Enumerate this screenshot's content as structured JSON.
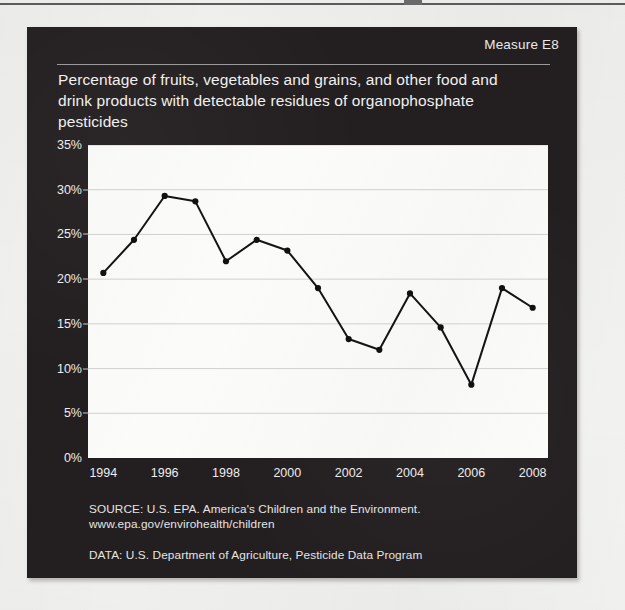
{
  "panel": {
    "measure_label": "Measure E8",
    "title": "Percentage of fruits, vegetables and grains, and other food and drink products with detectable residues of organophosphate pesticides",
    "source_note": "SOURCE: U.S. EPA. America's Children and the Environment.\nwww.epa.gov/envirohealth/children",
    "data_note": "DATA: U.S. Department of Agriculture, Pesticide Data Program",
    "colors": {
      "panel_background": "#231f20",
      "plot_background": "#fbfbf9",
      "text": "#eeeeee",
      "series_line": "#111111",
      "gridline": "#d0d0d0"
    }
  },
  "chart_data": {
    "type": "line",
    "title": "Percentage of fruits, vegetables and grains, and other food and drink products with detectable residues of organophosphate pesticides",
    "xlabel": "",
    "ylabel": "",
    "x": [
      1994,
      1995,
      1996,
      1997,
      1998,
      1999,
      2000,
      2001,
      2002,
      2003,
      2004,
      2005,
      2006,
      2007,
      2008
    ],
    "values": [
      20.7,
      24.4,
      29.3,
      28.7,
      22.0,
      24.4,
      23.2,
      19.0,
      13.3,
      12.1,
      18.4,
      14.6,
      8.2,
      19.0,
      16.8
    ],
    "series": [
      {
        "name": "Detectable organophosphate pesticide residues",
        "values": [
          20.7,
          24.4,
          29.3,
          28.7,
          22.0,
          24.4,
          23.2,
          19.0,
          13.3,
          12.1,
          18.4,
          14.6,
          8.2,
          19.0,
          16.8
        ]
      }
    ],
    "xlim": [
      1993.5,
      2008.5
    ],
    "ylim": [
      0,
      35
    ],
    "ytick_values": [
      0,
      5,
      10,
      15,
      20,
      25,
      30,
      35
    ],
    "ytick_labels": [
      "0%",
      "5%",
      "10%",
      "15%",
      "20%",
      "25%",
      "30%",
      "35%"
    ],
    "xtick_values": [
      1994,
      1996,
      1998,
      2000,
      2002,
      2004,
      2006,
      2008
    ],
    "xtick_labels": [
      "1994",
      "1996",
      "1998",
      "2000",
      "2002",
      "2004",
      "2006",
      "2008"
    ],
    "grid": "horizontal",
    "legend": "none",
    "markers": "filled-circle"
  }
}
